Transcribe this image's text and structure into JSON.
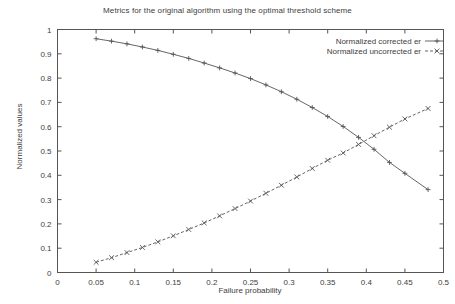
{
  "chart_data": {
    "type": "line",
    "title": "Metrics for the original algorithm using the optimal threshold scheme",
    "xlabel": "Failure probability",
    "ylabel": "Normalized values",
    "xlim": [
      0,
      0.5
    ],
    "ylim": [
      0,
      1
    ],
    "grid": false,
    "legend_position": "top-right",
    "xticks": [
      "0",
      "0.05",
      "0.1",
      "0.15",
      "0.2",
      "0.25",
      "0.3",
      "0.35",
      "0.4",
      "0.45",
      "0.5"
    ],
    "xtick_values": [
      0,
      0.05,
      0.1,
      0.15,
      0.2,
      0.25,
      0.3,
      0.35,
      0.4,
      0.45,
      0.5
    ],
    "yticks": [
      "0",
      "0.1",
      "0.2",
      "0.3",
      "0.4",
      "0.5",
      "0.6",
      "0.7",
      "0.8",
      "0.9",
      "1"
    ],
    "ytick_values": [
      0,
      0.1,
      0.2,
      0.3,
      0.4,
      0.5,
      0.6,
      0.7,
      0.8,
      0.9,
      1
    ],
    "series": [
      {
        "name": "Normalized corrected er",
        "marker": "plus",
        "linestyle": "solid",
        "color": "#555555",
        "x": [
          0.05,
          0.07,
          0.09,
          0.11,
          0.13,
          0.15,
          0.17,
          0.19,
          0.21,
          0.23,
          0.25,
          0.27,
          0.29,
          0.31,
          0.33,
          0.35,
          0.37,
          0.39,
          0.41,
          0.43,
          0.45,
          0.48
        ],
        "values": [
          0.962,
          0.952,
          0.941,
          0.928,
          0.914,
          0.898,
          0.881,
          0.862,
          0.842,
          0.821,
          0.798,
          0.772,
          0.744,
          0.713,
          0.679,
          0.642,
          0.601,
          0.556,
          0.507,
          0.453,
          0.408,
          0.341
        ]
      },
      {
        "name": "Normalized uncorrected er",
        "marker": "cross",
        "linestyle": "dashed",
        "color": "#555555",
        "x": [
          0.05,
          0.07,
          0.09,
          0.11,
          0.13,
          0.15,
          0.17,
          0.19,
          0.21,
          0.23,
          0.25,
          0.27,
          0.29,
          0.31,
          0.33,
          0.35,
          0.37,
          0.39,
          0.41,
          0.43,
          0.45,
          0.48
        ],
        "values": [
          0.042,
          0.061,
          0.082,
          0.103,
          0.126,
          0.151,
          0.177,
          0.204,
          0.233,
          0.263,
          0.294,
          0.326,
          0.359,
          0.393,
          0.428,
          0.462,
          0.492,
          0.527,
          0.563,
          0.598,
          0.632,
          0.675
        ]
      }
    ]
  },
  "legend": {
    "entries": [
      {
        "label": "Normalized corrected er"
      },
      {
        "label": "Normalized uncorrected er"
      }
    ]
  }
}
